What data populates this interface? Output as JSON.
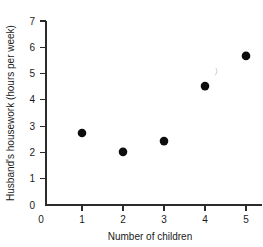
{
  "chart_data": {
    "type": "scatter",
    "title": "",
    "xlabel": "Number of children",
    "ylabel": "Husband's housework (hours per week)",
    "x": [
      1,
      2,
      3,
      4,
      5
    ],
    "values": [
      2.74,
      2.02,
      2.43,
      4.52,
      5.67
    ],
    "points": [
      {
        "x": 1,
        "y": 2.74
      },
      {
        "x": 2,
        "y": 2.02
      },
      {
        "x": 3,
        "y": 2.43
      },
      {
        "x": 4,
        "y": 4.52
      },
      {
        "x": 5,
        "y": 5.67
      }
    ],
    "xlim": [
      0,
      5.4
    ],
    "ylim": [
      0,
      7
    ],
    "xticks": [
      0,
      1,
      2,
      3,
      4,
      5
    ],
    "yticks": [
      0,
      1,
      2,
      3,
      4,
      5,
      6,
      7
    ],
    "xticklabels": [
      "0",
      "1",
      "2",
      "3",
      "4",
      "5"
    ],
    "yticklabels": [
      "0",
      "1",
      "2",
      "3",
      "4",
      "5",
      "6",
      "7"
    ],
    "grid": false,
    "legend": null,
    "marker": "filled-circle",
    "marker_color": "#0d0d0d",
    "axis_color": "#2b2b2b",
    "background": "#ffffff"
  },
  "axis_titles": {
    "x": "Number of children",
    "y": "Husband's housework (hours per week)"
  },
  "tick_labels": {
    "y7": "7",
    "y6": "6",
    "y5": "5",
    "y4": "4",
    "y3": "3",
    "y2": "2",
    "y1": "1",
    "y0": "0",
    "x0": "0",
    "x1": "1",
    "x2": "2",
    "x3": "3",
    "x4": "4",
    "x5": "5"
  }
}
